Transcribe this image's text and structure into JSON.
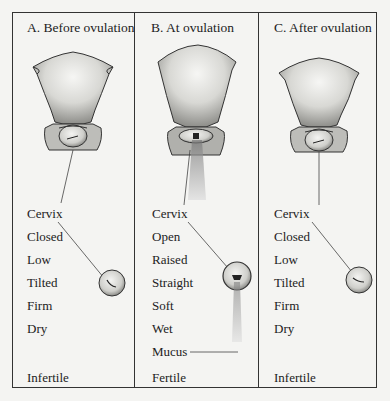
{
  "figure": {
    "columns": [
      {
        "id": "A",
        "title": "A. Before ovulation",
        "labels": [
          "Cervix",
          "Closed",
          "Low",
          "Tilted",
          "Firm",
          "Dry"
        ],
        "fertility": "Infertile"
      },
      {
        "id": "B",
        "title": "B. At ovulation",
        "labels": [
          "Cervix",
          "Open",
          "Raised",
          "Straight",
          "Soft",
          "Wet",
          "Mucus"
        ],
        "fertility": "Fertile"
      },
      {
        "id": "C",
        "title": "C. After ovulation",
        "labels": [
          "Cervix",
          "Closed",
          "Low",
          "Tilted",
          "Firm",
          "Dry"
        ],
        "fertility": "Infertile"
      }
    ],
    "colors": {
      "background": "#f4f4f2",
      "line": "#333333",
      "text": "#222222"
    }
  }
}
